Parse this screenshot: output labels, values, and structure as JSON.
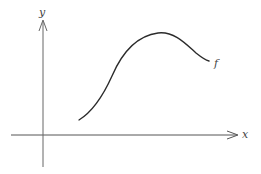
{
  "figure": {
    "type": "function-sketch",
    "axes": {
      "x_label": "x",
      "y_label": "y",
      "ticks": false
    },
    "curve": {
      "label": "f",
      "shape": "rises from lower left to a single maximum, then decreases",
      "color": "#2b2b2b"
    },
    "colors": {
      "axis": "#555555",
      "curve": "#2b2b2b",
      "label": "#444444",
      "background": "#ffffff"
    }
  }
}
